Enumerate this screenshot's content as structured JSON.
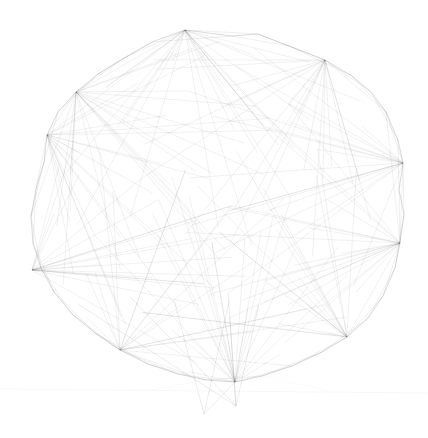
{
  "figure": {
    "type": "network-graph",
    "title": "",
    "background_color": "#ffffff",
    "width": 428,
    "height": 438
  },
  "chart_data": {
    "type": "scatter",
    "subtype": "force-directed-node-link-graph",
    "title": "",
    "subtitle": "",
    "xlabel": "",
    "ylabel": "",
    "grid": false,
    "axes_visible": false,
    "tick_labels": [],
    "legend": null,
    "annotations": [],
    "xlim": [
      0,
      428
    ],
    "ylim": [
      0,
      438
    ],
    "rendering": {
      "node_marker": "none",
      "edge_style": "straight-line",
      "edge_color": "#3a3a3a",
      "edge_opacity": 0.17,
      "edge_width": 0.45,
      "outlier_edge_opacity": 0.09,
      "core_density_color": "#8a8a8a",
      "hull_edge_color": "#6e6e6e"
    },
    "layout": {
      "algorithm": "force-directed",
      "seed": 20240517,
      "node_count": 520,
      "edge_count": 3400,
      "center_x": 218,
      "center_y": 213,
      "radius_x": 178,
      "radius_y": 186,
      "core_radius_fraction": 0.52,
      "hull_ring_count": 3
    },
    "extents": {
      "leftmost_x": 30,
      "rightmost_x": 405,
      "topmost_y": 28,
      "bottommost_y": 416
    },
    "hull_vertices": [
      [
        185,
        30
      ],
      [
        232,
        36
      ],
      [
        258,
        34
      ],
      [
        289,
        46
      ],
      [
        325,
        60
      ],
      [
        352,
        76
      ],
      [
        371,
        92
      ],
      [
        386,
        112
      ],
      [
        398,
        140
      ],
      [
        403,
        163
      ],
      [
        399,
        190
      ],
      [
        404,
        214
      ],
      [
        400,
        243
      ],
      [
        395,
        268
      ],
      [
        383,
        296
      ],
      [
        368,
        318
      ],
      [
        347,
        337
      ],
      [
        322,
        352
      ],
      [
        292,
        366
      ],
      [
        262,
        376
      ],
      [
        235,
        382
      ],
      [
        206,
        380
      ],
      [
        178,
        374
      ],
      [
        148,
        364
      ],
      [
        120,
        350
      ],
      [
        95,
        333
      ],
      [
        72,
        314
      ],
      [
        54,
        292
      ],
      [
        41,
        268
      ],
      [
        33,
        243
      ],
      [
        31,
        216
      ],
      [
        36,
        189
      ],
      [
        44,
        162
      ],
      [
        47,
        135
      ],
      [
        58,
        112
      ],
      [
        76,
        92
      ],
      [
        98,
        74
      ],
      [
        124,
        58
      ],
      [
        152,
        42
      ]
    ],
    "spike_nodes": [
      [
        204,
        414
      ],
      [
        236,
        406
      ]
    ],
    "outlier_edges": [
      {
        "from": [
          0,
          389
        ],
        "to": [
          428,
          393
        ],
        "opacity": 0.07
      }
    ],
    "hub_nodes": [
      [
        47,
        135
      ],
      [
        32,
        270
      ],
      [
        185,
        30
      ],
      [
        403,
        163
      ],
      [
        400,
        243
      ],
      [
        235,
        382
      ],
      [
        120,
        350
      ],
      [
        347,
        337
      ],
      [
        76,
        92
      ],
      [
        325,
        60
      ]
    ]
  }
}
